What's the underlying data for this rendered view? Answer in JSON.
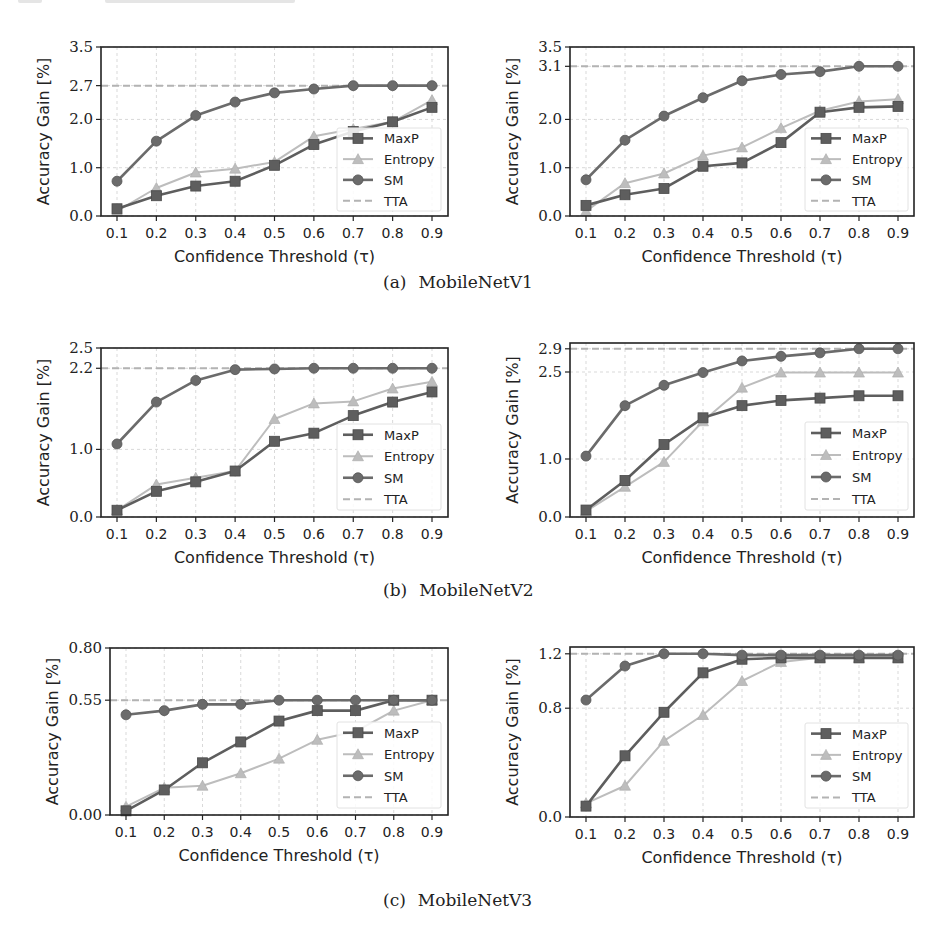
{
  "figure": {
    "header_fragment": "page header text (cropped at top edge)",
    "subfigures": [
      {
        "tag": "(a)",
        "label": "MobileNetV1"
      },
      {
        "tag": "(b)",
        "label": "MobileNetV2"
      },
      {
        "tag": "(c)",
        "label": "MobileNetV3"
      }
    ]
  },
  "styles": {
    "maxp_color": "#5e5e5e",
    "entropy_color": "#bdbdbd",
    "sm_color": "#6b6b6b",
    "tta_color": "#b3b3b3",
    "grid_color": "#d9d9d9",
    "axis_color": "#222222"
  },
  "chart_data": [
    {
      "id": "a-left",
      "type": "line",
      "panel": "(a) MobileNetV1",
      "title": "",
      "xlabel": "Confidence Threshold (τ)",
      "ylabel": "Accuracy Gain [%]",
      "x": [
        0.1,
        0.2,
        0.3,
        0.4,
        0.5,
        0.6,
        0.7,
        0.8,
        0.9
      ],
      "xticks": [
        "0.1",
        "0.2",
        "0.3",
        "0.4",
        "0.5",
        "0.6",
        "0.7",
        "0.8",
        "0.9"
      ],
      "yticks": [
        "0.0",
        "1.0",
        "2.0",
        "2.7",
        "3.5"
      ],
      "ytick_values": [
        0.0,
        1.0,
        2.0,
        2.7,
        3.5
      ],
      "ylim": [
        0.0,
        3.5
      ],
      "series": [
        {
          "name": "MaxP",
          "marker": "square",
          "values": [
            0.15,
            0.42,
            0.62,
            0.72,
            1.05,
            1.48,
            1.75,
            1.95,
            2.25
          ]
        },
        {
          "name": "Entropy",
          "marker": "triangle",
          "values": [
            0.1,
            0.58,
            0.9,
            0.98,
            1.12,
            1.65,
            1.8,
            1.95,
            2.4
          ]
        },
        {
          "name": "SM",
          "marker": "circle",
          "values": [
            0.72,
            1.55,
            2.08,
            2.36,
            2.55,
            2.63,
            2.7,
            2.7,
            2.7
          ]
        }
      ],
      "reference": {
        "name": "TTA",
        "style": "dashed",
        "value": 2.7
      },
      "legend": {
        "position": "center right",
        "entries": [
          "MaxP",
          "Entropy",
          "SM",
          "TTA"
        ]
      },
      "grid": true
    },
    {
      "id": "a-right",
      "type": "line",
      "panel": "(a) MobileNetV1",
      "title": "",
      "xlabel": "Confidence Threshold (τ)",
      "ylabel": "Accuracy Gain [%]",
      "x": [
        0.1,
        0.2,
        0.3,
        0.4,
        0.5,
        0.6,
        0.7,
        0.8,
        0.9
      ],
      "xticks": [
        "0.1",
        "0.2",
        "0.3",
        "0.4",
        "0.5",
        "0.6",
        "0.7",
        "0.8",
        "0.9"
      ],
      "yticks": [
        "0.0",
        "1.0",
        "2.0",
        "3.1",
        "3.5"
      ],
      "ytick_values": [
        0.0,
        1.0,
        2.0,
        3.1,
        3.5
      ],
      "ylim": [
        0.0,
        3.5
      ],
      "series": [
        {
          "name": "MaxP",
          "marker": "square",
          "values": [
            0.22,
            0.44,
            0.57,
            1.03,
            1.1,
            1.52,
            2.15,
            2.25,
            2.27
          ]
        },
        {
          "name": "Entropy",
          "marker": "triangle",
          "values": [
            0.1,
            0.68,
            0.88,
            1.25,
            1.42,
            1.82,
            2.18,
            2.37,
            2.42
          ]
        },
        {
          "name": "SM",
          "marker": "circle",
          "values": [
            0.75,
            1.57,
            2.07,
            2.45,
            2.8,
            2.93,
            2.99,
            3.1,
            3.1
          ]
        }
      ],
      "reference": {
        "name": "TTA",
        "style": "dashed",
        "value": 3.1
      },
      "legend": {
        "position": "center right",
        "entries": [
          "MaxP",
          "Entropy",
          "SM",
          "TTA"
        ]
      },
      "grid": true
    },
    {
      "id": "b-left",
      "type": "line",
      "panel": "(b) MobileNetV2",
      "title": "",
      "xlabel": "Confidence Threshold (τ)",
      "ylabel": "Accuracy Gain [%]",
      "x": [
        0.1,
        0.2,
        0.3,
        0.4,
        0.5,
        0.6,
        0.7,
        0.8,
        0.9
      ],
      "xticks": [
        "0.1",
        "0.2",
        "0.3",
        "0.4",
        "0.5",
        "0.6",
        "0.7",
        "0.8",
        "0.9"
      ],
      "yticks": [
        "0.0",
        "1.0",
        "2.2",
        "2.5"
      ],
      "ytick_values": [
        0.0,
        1.0,
        2.2,
        2.5
      ],
      "ylim": [
        0.0,
        2.5
      ],
      "series": [
        {
          "name": "MaxP",
          "marker": "square",
          "values": [
            0.1,
            0.38,
            0.52,
            0.68,
            1.12,
            1.24,
            1.5,
            1.7,
            1.85
          ]
        },
        {
          "name": "Entropy",
          "marker": "triangle",
          "values": [
            0.1,
            0.48,
            0.58,
            0.68,
            1.45,
            1.68,
            1.71,
            1.9,
            2.0
          ]
        },
        {
          "name": "SM",
          "marker": "circle",
          "values": [
            1.08,
            1.7,
            2.02,
            2.18,
            2.19,
            2.2,
            2.2,
            2.2,
            2.2
          ]
        }
      ],
      "reference": {
        "name": "TTA",
        "style": "dashed",
        "value": 2.2
      },
      "legend": {
        "position": "center right",
        "entries": [
          "MaxP",
          "Entropy",
          "SM",
          "TTA"
        ]
      },
      "grid": true
    },
    {
      "id": "b-right",
      "type": "line",
      "panel": "(b) MobileNetV2",
      "title": "",
      "xlabel": "Confidence Threshold (τ)",
      "ylabel": "Accuracy Gain [%]",
      "x": [
        0.1,
        0.2,
        0.3,
        0.4,
        0.5,
        0.6,
        0.7,
        0.8,
        0.9
      ],
      "xticks": [
        "0.1",
        "0.2",
        "0.3",
        "0.4",
        "0.5",
        "0.6",
        "0.7",
        "0.8",
        "0.9"
      ],
      "yticks": [
        "0.0",
        "1.0",
        "2.5",
        "2.9"
      ],
      "ytick_values": [
        0.0,
        1.0,
        2.5,
        2.9
      ],
      "ylim": [
        0.0,
        3.0
      ],
      "series": [
        {
          "name": "MaxP",
          "marker": "square",
          "values": [
            0.12,
            0.63,
            1.25,
            1.71,
            1.92,
            2.01,
            2.05,
            2.09,
            2.09
          ]
        },
        {
          "name": "Entropy",
          "marker": "triangle",
          "values": [
            0.1,
            0.52,
            0.95,
            1.65,
            2.23,
            2.49,
            2.49,
            2.49,
            2.49
          ]
        },
        {
          "name": "SM",
          "marker": "circle",
          "values": [
            1.05,
            1.92,
            2.27,
            2.49,
            2.69,
            2.77,
            2.83,
            2.9,
            2.9
          ]
        }
      ],
      "reference": {
        "name": "TTA",
        "style": "dashed",
        "value": 2.9
      },
      "legend": {
        "position": "lower right",
        "entries": [
          "MaxP",
          "Entropy",
          "SM",
          "TTA"
        ]
      },
      "grid": true
    },
    {
      "id": "c-left",
      "type": "line",
      "panel": "(c) MobileNetV3",
      "title": "",
      "xlabel": "Confidence Threshold (τ)",
      "ylabel": "Accuracy Gain [%]",
      "x": [
        0.1,
        0.2,
        0.3,
        0.4,
        0.5,
        0.6,
        0.7,
        0.8,
        0.9
      ],
      "xticks": [
        "0.1",
        "0.2",
        "0.3",
        "0.4",
        "0.5",
        "0.6",
        "0.7",
        "0.8",
        "0.9"
      ],
      "yticks": [
        "0.00",
        "0.55",
        "0.80"
      ],
      "ytick_values": [
        0.0,
        0.55,
        0.8
      ],
      "ylim": [
        0.0,
        0.8
      ],
      "series": [
        {
          "name": "MaxP",
          "marker": "square",
          "values": [
            0.02,
            0.12,
            0.25,
            0.35,
            0.45,
            0.5,
            0.5,
            0.55,
            0.55
          ]
        },
        {
          "name": "Entropy",
          "marker": "triangle",
          "values": [
            0.04,
            0.13,
            0.14,
            0.2,
            0.27,
            0.36,
            0.4,
            0.5,
            0.55
          ]
        },
        {
          "name": "SM",
          "marker": "circle",
          "values": [
            0.48,
            0.5,
            0.53,
            0.53,
            0.55,
            0.55,
            0.55,
            0.55,
            0.55
          ]
        }
      ],
      "reference": {
        "name": "TTA",
        "style": "dashed",
        "value": 0.55
      },
      "legend": {
        "position": "lower right",
        "entries": [
          "MaxP",
          "Entropy",
          "SM",
          "TTA"
        ]
      },
      "grid": true
    },
    {
      "id": "c-right",
      "type": "line",
      "panel": "(c) MobileNetV3",
      "title": "",
      "xlabel": "Confidence Threshold (τ)",
      "ylabel": "Accuracy Gain [%]",
      "x": [
        0.1,
        0.2,
        0.3,
        0.4,
        0.5,
        0.6,
        0.7,
        0.8,
        0.9
      ],
      "xticks": [
        "0.1",
        "0.2",
        "0.3",
        "0.4",
        "0.5",
        "0.6",
        "0.7",
        "0.8",
        "0.9"
      ],
      "yticks": [
        "0.0",
        "0.8",
        "1.2"
      ],
      "ytick_values": [
        0.0,
        0.8,
        1.2
      ],
      "ylim": [
        0.0,
        1.25
      ],
      "series": [
        {
          "name": "MaxP",
          "marker": "square",
          "values": [
            0.08,
            0.45,
            0.77,
            1.06,
            1.16,
            1.17,
            1.17,
            1.17,
            1.17
          ]
        },
        {
          "name": "Entropy",
          "marker": "triangle",
          "values": [
            0.1,
            0.23,
            0.56,
            0.75,
            1.0,
            1.14,
            1.17,
            1.17,
            1.17
          ]
        },
        {
          "name": "SM",
          "marker": "circle",
          "values": [
            0.86,
            1.11,
            1.2,
            1.2,
            1.19,
            1.19,
            1.19,
            1.19,
            1.19
          ]
        }
      ],
      "reference": {
        "name": "TTA",
        "style": "dashed",
        "value": 1.2
      },
      "legend": {
        "position": "lower right",
        "entries": [
          "MaxP",
          "Entropy",
          "SM",
          "TTA"
        ]
      },
      "grid": true
    }
  ],
  "layout": {
    "panels": [
      {
        "id": "a-left",
        "box": [
          101,
          47,
          448,
          216
        ]
      },
      {
        "id": "a-right",
        "box": [
          570,
          47,
          914,
          216
        ]
      },
      {
        "id": "b-left",
        "box": [
          101,
          348,
          448,
          517
        ]
      },
      {
        "id": "b-right",
        "box": [
          570,
          343,
          914,
          517
        ]
      },
      {
        "id": "c-left",
        "box": [
          110,
          648,
          448,
          815
        ]
      },
      {
        "id": "c-right",
        "box": [
          570,
          647,
          914,
          817
        ]
      }
    ],
    "legend_boxes": {
      "a-left": [
        337,
        128,
        441,
        211
      ],
      "a-right": [
        805,
        128,
        908,
        211
      ],
      "b-left": [
        337,
        424,
        441,
        510
      ],
      "b-right": [
        805,
        422,
        908,
        510
      ],
      "c-left": [
        337,
        722,
        441,
        808
      ],
      "c-right": [
        805,
        723,
        908,
        808
      ]
    },
    "captions": [
      {
        "x": 383,
        "y": 283
      },
      {
        "x": 383,
        "y": 591
      },
      {
        "x": 383,
        "y": 901
      }
    ]
  }
}
